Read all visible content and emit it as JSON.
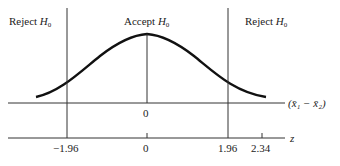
{
  "regions": {
    "left": {
      "text": "Reject",
      "sym": "H",
      "sub": "0"
    },
    "center": {
      "text": "Accept",
      "sym": "H",
      "sub": "0"
    },
    "right": {
      "text": "Reject",
      "sym": "H",
      "sub": "0"
    }
  },
  "axes": {
    "upper": {
      "label": "(x̄₁ − x̄₂)",
      "ticks": [
        {
          "value": "0"
        }
      ]
    },
    "lower": {
      "label": "z",
      "ticks": [
        {
          "value": "−1.96"
        },
        {
          "value": "0"
        },
        {
          "value": "1.96"
        },
        {
          "value": "2.34"
        }
      ]
    }
  },
  "colors": {
    "line": "#333333",
    "curve": "#111111"
  }
}
